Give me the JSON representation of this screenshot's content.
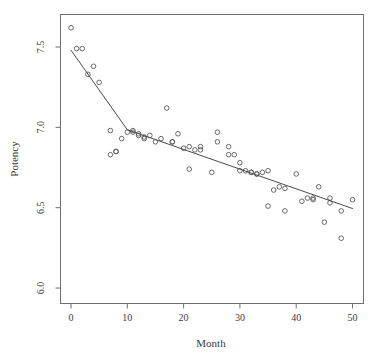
{
  "chart_data": {
    "type": "scatter",
    "title": "",
    "xlabel": "Month",
    "ylabel": "Potency",
    "xlim": [
      -1.5,
      52.0
    ],
    "ylim": [
      5.9,
      7.63
    ],
    "xticks": [
      0,
      10,
      20,
      30,
      40,
      50
    ],
    "xtick_labels": [
      "0",
      "10",
      "20",
      "30",
      "40",
      "50"
    ],
    "yticks": [
      6.0,
      6.5,
      7.0,
      7.5
    ],
    "ytick_labels": [
      "6.0",
      "6.5",
      "7.0",
      "7.5"
    ],
    "grid": false,
    "legend": null,
    "point_marker": "open-circle",
    "point_color": "#58585d",
    "line_color": "#4a4a4a",
    "frame_color": "#6f6f6f",
    "background_color": "#ffffff",
    "series": [
      {
        "name": "Potency observations",
        "type": "scatter",
        "x": [
          0,
          1,
          2,
          3,
          4,
          5,
          7,
          7,
          8,
          8,
          9,
          10,
          11,
          11,
          12,
          12,
          13,
          13,
          14,
          15,
          16,
          17,
          18,
          18,
          19,
          20,
          21,
          21,
          22,
          23,
          23,
          25,
          26,
          26,
          28,
          28,
          29,
          30,
          30,
          31,
          32,
          32,
          33,
          33,
          34,
          35,
          35,
          36,
          37,
          38,
          38,
          40,
          41,
          42,
          43,
          43,
          44,
          45,
          46,
          46,
          48,
          48,
          50
        ],
        "y": [
          7.62,
          7.49,
          7.49,
          7.33,
          7.38,
          7.28,
          6.98,
          6.83,
          6.85,
          6.85,
          6.93,
          6.97,
          6.97,
          6.98,
          6.96,
          6.95,
          6.94,
          6.93,
          6.95,
          6.91,
          6.93,
          7.12,
          6.91,
          6.91,
          6.96,
          6.87,
          6.88,
          6.74,
          6.86,
          6.88,
          6.86,
          6.72,
          6.97,
          6.91,
          6.83,
          6.88,
          6.83,
          6.73,
          6.78,
          6.73,
          6.72,
          6.72,
          6.71,
          6.71,
          6.72,
          6.51,
          6.73,
          6.61,
          6.63,
          6.48,
          6.62,
          6.71,
          6.54,
          6.56,
          6.56,
          6.55,
          6.63,
          6.41,
          6.53,
          6.56,
          6.31,
          6.48,
          6.55
        ]
      },
      {
        "name": "Segmented regression fit",
        "type": "line",
        "breakpoint_month": 10,
        "x": [
          0,
          10,
          50
        ],
        "y": [
          7.48,
          6.985,
          6.495
        ]
      }
    ]
  },
  "figure": {
    "axis_label_x": "Month",
    "axis_label_y": "Potency"
  }
}
